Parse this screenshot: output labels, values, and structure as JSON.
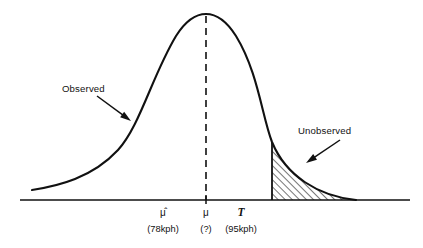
{
  "figure": {
    "type": "statistical-density-diagram",
    "background_color": "#ffffff",
    "ink_color": "#111111"
  },
  "annotations": [
    {
      "id": "observed",
      "label": "Observed",
      "text_x": 62,
      "text_y": 92,
      "leader_from": [
        97,
        96
      ],
      "leader_to": [
        131,
        121
      ],
      "arrow_angle_deg": 36
    },
    {
      "id": "unobserved",
      "label": "Unobserved",
      "text_x": 298,
      "text_y": 134,
      "leader_from": [
        340,
        140
      ],
      "leader_to": [
        306,
        163
      ],
      "arrow_angle_deg": 214
    }
  ],
  "axis": {
    "baseline_y": 200,
    "x_start": 20,
    "x_end": 410,
    "ticks": [
      {
        "id": "mu-hat",
        "symbol": "μ̂",
        "value": "(78kph)",
        "x": 163,
        "symbol_y": 216,
        "value_y": 232,
        "has_tick_mark": false
      },
      {
        "id": "mu",
        "symbol": "μ",
        "value": "(?)",
        "x": 206,
        "symbol_y": 216,
        "value_y": 232,
        "has_tick_mark": true
      },
      {
        "id": "threshold-T",
        "symbol": "T",
        "value": "(95kph)",
        "x": 241,
        "symbol_y": 216,
        "value_y": 232,
        "has_tick_mark": false
      }
    ]
  },
  "curve": {
    "peak_x": 206,
    "peak_y": 14,
    "left_tail_x": 32,
    "left_tail_y": 190,
    "right_tail_x": 356,
    "right_tail_y": 200,
    "path": "M 32 190 C 58 186, 92 178, 118 150 C 140 126, 152 76, 176 36 C 188 17, 198 14, 206 14 C 214 14, 224 17, 236 36 C 258 72, 262 116, 272 142 C 286 176, 318 196, 356 200"
  },
  "shaded_region": {
    "id": "unobserved-tail",
    "threshold_x": 272,
    "threshold_top_y": 142,
    "fill_pattern": "diagonal-hatch-45",
    "hatch_spacing_px": 5,
    "path": "M 272 142 C 286 176, 318 196, 356 200 L 356 200 L 272 200 Z"
  },
  "dashed_mean_line": {
    "x": 206,
    "y_top": 16,
    "y_bottom": 200
  }
}
